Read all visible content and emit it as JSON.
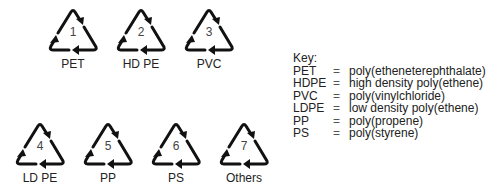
{
  "symbols": [
    {
      "code": "1",
      "label": "PET",
      "x": 47,
      "y": 7
    },
    {
      "code": "2",
      "label": "HD PE",
      "x": 115,
      "y": 7
    },
    {
      "code": "3",
      "label": "PVC",
      "x": 183,
      "y": 7
    },
    {
      "code": "4",
      "label": "LD PE",
      "x": 14,
      "y": 121
    },
    {
      "code": "5",
      "label": "PP",
      "x": 82,
      "y": 121
    },
    {
      "code": "6",
      "label": "PS",
      "x": 150,
      "y": 121
    },
    {
      "code": "7",
      "label": "Others",
      "x": 218,
      "y": 121
    }
  ],
  "key": {
    "title": "Key:",
    "entries": [
      {
        "abbr": "PET",
        "eq": "=",
        "meaning": "poly(etheneterephthalate)"
      },
      {
        "abbr": "HDPE",
        "eq": "=",
        "meaning": "high density poly(ethene)"
      },
      {
        "abbr": "PVC",
        "eq": "=",
        "meaning": "poly(vinylchloride)"
      },
      {
        "abbr": "LDPE",
        "eq": "=",
        "meaning": "low density poly(ethene)"
      },
      {
        "abbr": "PP",
        "eq": "=",
        "meaning": "poly(propene)"
      },
      {
        "abbr": "PS",
        "eq": "=",
        "meaning": "poly(styrene)"
      }
    ]
  }
}
